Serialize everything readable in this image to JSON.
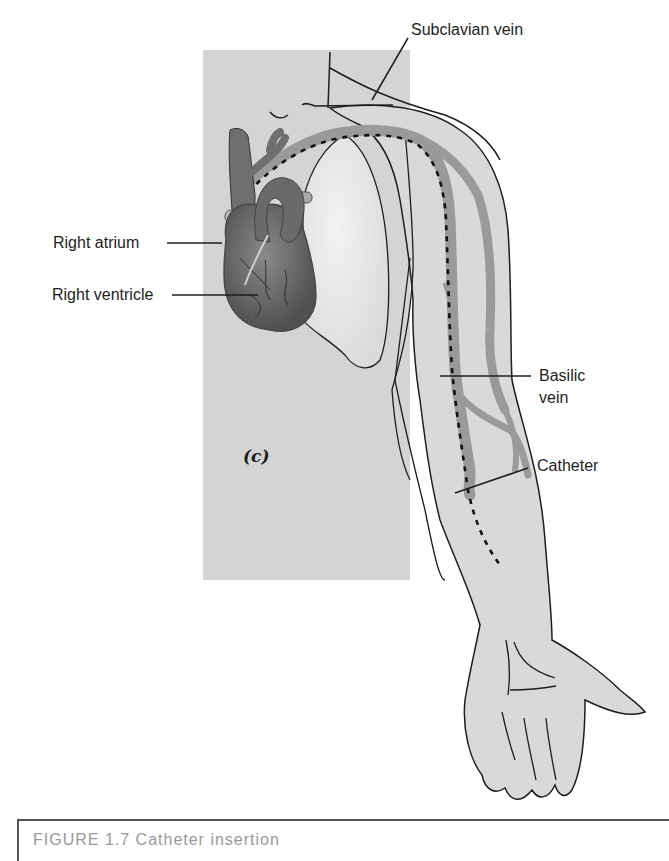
{
  "figure": {
    "panel_label": "(c)",
    "labels": {
      "subclavian_vein": "Subclavian vein",
      "right_atrium": "Right atrium",
      "right_ventricle": "Right ventricle",
      "basilic_vein": "Basilic vein",
      "basilic_vein_line1": "Basilic",
      "basilic_vein_line2": "vein",
      "catheter": "Catheter"
    },
    "caption": {
      "text": "FIGURE 1.7  Catheter insertion"
    },
    "colors": {
      "background": "#ffffff",
      "panel_gray": "#d4d4d4",
      "skin_gray": "#d9d9d9",
      "lung_light": "#ececec",
      "vein_gray": "#9a9a9a",
      "heart_dark": "#6e6e6e",
      "outline": "#1e1e1e"
    }
  }
}
